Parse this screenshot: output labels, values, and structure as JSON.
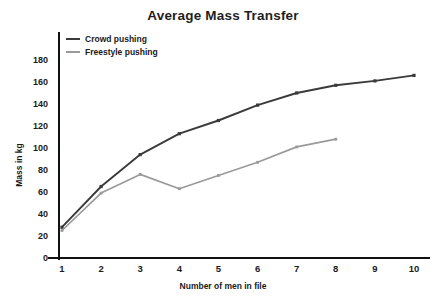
{
  "chart_data": {
    "type": "line",
    "title": "Average Mass Transfer",
    "xlabel": "Number of men in file",
    "ylabel": "Mass in kg",
    "x": [
      1,
      2,
      3,
      4,
      5,
      6,
      7,
      8,
      9,
      10
    ],
    "xticklabels": [
      "1",
      "2",
      "3",
      "4",
      "5",
      "6",
      "7",
      "8",
      "9",
      "10"
    ],
    "yticks": [
      0,
      20,
      40,
      60,
      80,
      100,
      120,
      140,
      160,
      180
    ],
    "yticklabels": [
      "0",
      "20",
      "40",
      "60",
      "80",
      "100",
      "120",
      "140",
      "160",
      "180"
    ],
    "xlim": [
      1,
      10
    ],
    "ylim": [
      0,
      190
    ],
    "grid": false,
    "legend_position": "upper left",
    "markers": true,
    "series": [
      {
        "name": "Crowd pushing",
        "color": "#3a3a3a",
        "x": [
          1,
          2,
          3,
          4,
          5,
          6,
          7,
          8,
          9,
          10
        ],
        "values": [
          28,
          65,
          94,
          113,
          125,
          139,
          150,
          157,
          161,
          166
        ]
      },
      {
        "name": "Freestyle pushing",
        "color": "#9a9a9a",
        "x": [
          1,
          2,
          3,
          4,
          5,
          6,
          7,
          8
        ],
        "values": [
          25,
          59,
          76,
          63,
          75,
          87,
          101,
          108
        ]
      }
    ]
  },
  "axis": {
    "line_color": "#111111"
  }
}
